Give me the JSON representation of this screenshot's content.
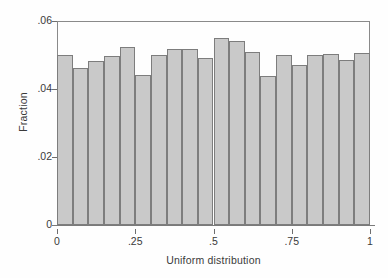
{
  "chart_data": {
    "type": "bar",
    "title": "",
    "subtitle": "",
    "xlabel": "Uniform distribution",
    "ylabel": "Fraction",
    "xlim": [
      0,
      1
    ],
    "ylim": [
      0,
      0.06
    ],
    "grid": false,
    "legend": null,
    "bin_width": 0.05,
    "bin_edges": [
      0,
      0.05,
      0.1,
      0.15,
      0.2,
      0.25,
      0.3,
      0.35,
      0.4,
      0.45,
      0.5,
      0.55,
      0.6,
      0.65,
      0.7,
      0.75,
      0.8,
      0.85,
      0.9,
      0.95,
      1
    ],
    "categories": [
      "0-.05",
      ".05-.1",
      ".1-.15",
      ".15-.2",
      ".2-.25",
      ".25-.3",
      ".3-.35",
      ".35-.4",
      ".4-.45",
      ".45-.5",
      ".5-.55",
      ".55-.6",
      ".6-.65",
      ".65-.7",
      ".7-.75",
      ".75-.8",
      ".8-.85",
      ".85-.9",
      ".9-.95",
      ".95-1"
    ],
    "values": [
      0.05,
      0.0461,
      0.0481,
      0.0496,
      0.0525,
      0.044,
      0.05,
      0.0517,
      0.0517,
      0.0491,
      0.0551,
      0.054,
      0.0509,
      0.0437,
      0.05,
      0.0472,
      0.05,
      0.0504,
      0.0485,
      0.0506
    ],
    "xticks": [
      0,
      0.25,
      0.5,
      0.75,
      1
    ],
    "xtick_labels": [
      "0",
      ".25",
      ".5",
      ".75",
      "1"
    ],
    "yticks": [
      0,
      0.02,
      0.04,
      0.06
    ],
    "ytick_labels": [
      "0",
      ".02",
      ".04",
      ".06"
    ],
    "bar_fill_color": "#c9c9c9",
    "bar_edge_color": "#7d7d7d",
    "axis_color": "#8a8a8a",
    "text_color": "#3a3a3a",
    "background_color": "#ffffff"
  }
}
